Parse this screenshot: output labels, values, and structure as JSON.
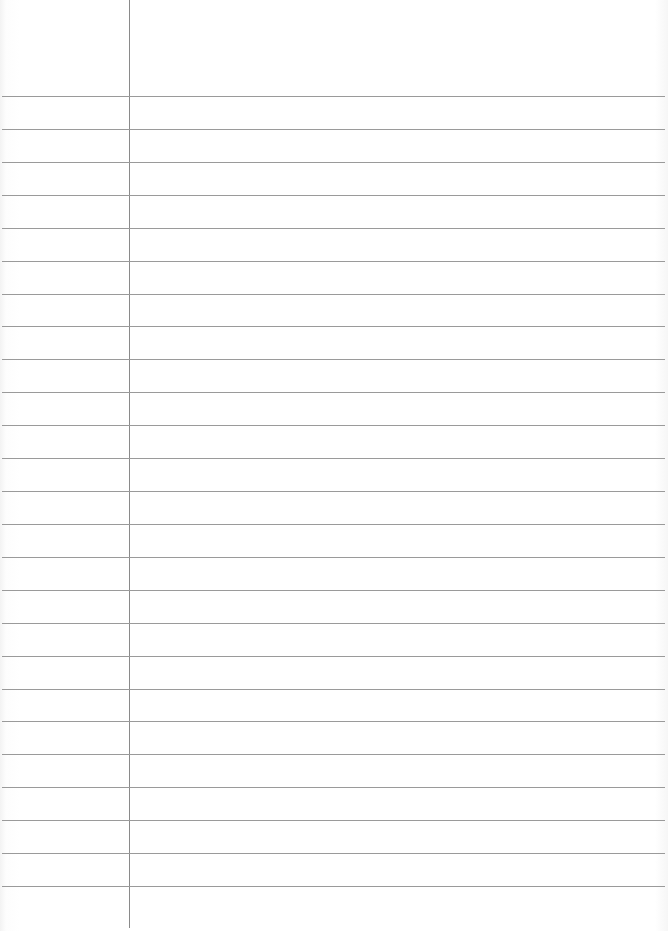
{
  "page": {
    "description": "Blank ruled notebook paper",
    "ruled_line_count": 25,
    "has_margin_line": true,
    "colors": {
      "paper": "#ffffff",
      "rule_line": "#9a9a9a",
      "margin_line": "#8a8a8a"
    }
  }
}
